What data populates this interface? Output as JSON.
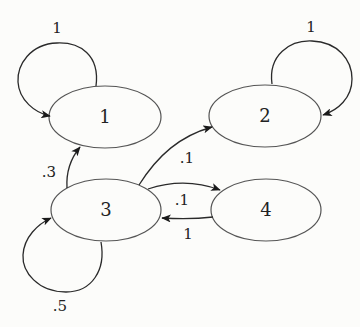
{
  "diagram": {
    "type": "markov-chain-state-diagram",
    "nodes": [
      {
        "id": "1",
        "label": "1"
      },
      {
        "id": "2",
        "label": "2"
      },
      {
        "id": "3",
        "label": "3"
      },
      {
        "id": "4",
        "label": "4"
      }
    ],
    "edges": [
      {
        "from": "1",
        "to": "1",
        "label": "1"
      },
      {
        "from": "2",
        "to": "2",
        "label": "1"
      },
      {
        "from": "3",
        "to": "3",
        "label": ".5"
      },
      {
        "from": "3",
        "to": "1",
        "label": ".3"
      },
      {
        "from": "3",
        "to": "2",
        "label": ".1"
      },
      {
        "from": "3",
        "to": "4",
        "label": ".1"
      },
      {
        "from": "4",
        "to": "3",
        "label": "1"
      }
    ],
    "colors": {
      "background": "#fcfcfa",
      "node_stroke": "#555555",
      "edge_stroke": "#2a2a2a",
      "text": "#222222"
    }
  }
}
